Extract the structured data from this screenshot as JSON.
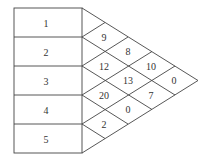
{
  "diagram": {
    "type": "triangular-lattice",
    "inputs": [
      "1",
      "2",
      "3",
      "4",
      "5"
    ],
    "cells": [
      {
        "row": 1,
        "pos": 1,
        "value": "9"
      },
      {
        "row": 1,
        "pos": 2,
        "value": "12"
      },
      {
        "row": 1,
        "pos": 3,
        "value": "20"
      },
      {
        "row": 1,
        "pos": 4,
        "value": "2"
      },
      {
        "row": 2,
        "pos": 1,
        "value": "8"
      },
      {
        "row": 2,
        "pos": 2,
        "value": "13"
      },
      {
        "row": 2,
        "pos": 3,
        "value": "0"
      },
      {
        "row": 3,
        "pos": 1,
        "value": "10"
      },
      {
        "row": 3,
        "pos": 2,
        "value": "7"
      },
      {
        "row": 4,
        "pos": 1,
        "value": "0"
      }
    ],
    "colors": {
      "line": "#444444",
      "text": "#333333",
      "background": "#ffffff"
    }
  }
}
